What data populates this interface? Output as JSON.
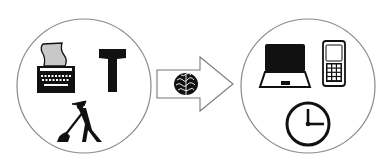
{
  "diagram": {
    "left_group": {
      "label": "traditional-work",
      "icons": [
        "typewriter-icon",
        "hammer-icon",
        "laborer-shoveling-icon"
      ]
    },
    "transition": {
      "icon": "arrow-right-icon",
      "inner_icon": "brain-icon"
    },
    "right_group": {
      "label": "digital-work",
      "icons": [
        "laptop-icon",
        "mobile-phone-icon",
        "clock-icon"
      ]
    },
    "colors": {
      "background": "#ffffff",
      "outline": "#8a8a8a",
      "icon": "#111111",
      "paper": "#c8c8c8"
    }
  }
}
